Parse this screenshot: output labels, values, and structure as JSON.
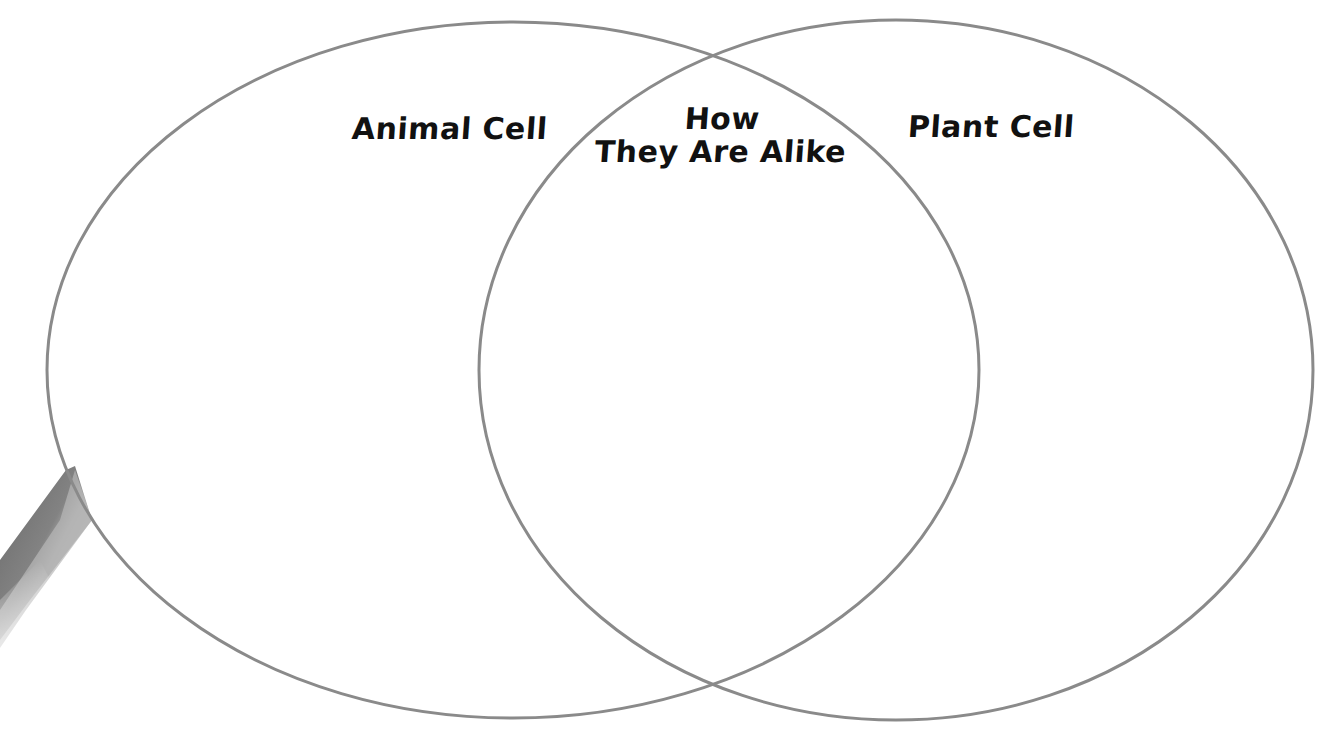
{
  "diagram": {
    "type": "venn",
    "stroke_color": "#8a8a8a",
    "background": "#ffffff",
    "text_color": "#111111",
    "circles": [
      {
        "name": "Animal Cell",
        "label": "Animal Cell"
      },
      {
        "name": "Plant Cell",
        "label": "Plant Cell"
      }
    ],
    "overlap": {
      "label_line1": "How",
      "label_line2": "They Are Alike"
    }
  },
  "decorations": {
    "pencil": {
      "colors": [
        "#6e6e6e",
        "#9a9a9a",
        "#c4c4c4"
      ]
    }
  }
}
